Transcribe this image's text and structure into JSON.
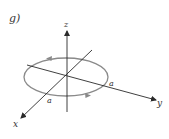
{
  "figure": {
    "panel_label": "g)",
    "axes": {
      "x_label": "x",
      "y_label": "y",
      "z_label": "z"
    },
    "loop": {
      "radius_labels": [
        "a",
        "a"
      ],
      "direction_arrows": [
        "left-on-top",
        "right-on-bottom"
      ]
    },
    "colors": {
      "axis": "#2a2a2a",
      "loop": "#8a8a8a",
      "text": "#333333"
    }
  }
}
